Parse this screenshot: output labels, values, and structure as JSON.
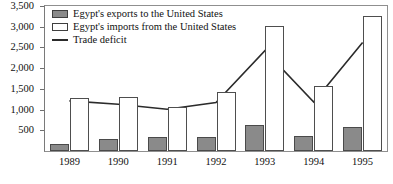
{
  "chart_data": {
    "type": "bar",
    "title": "",
    "subtitle": "",
    "xlabel": "",
    "ylabel": "",
    "categories": [
      "1989",
      "1990",
      "1991",
      "1992",
      "1993",
      "1994",
      "1995"
    ],
    "ylim": [
      0,
      3500
    ],
    "yticks": [
      500,
      1000,
      1500,
      2000,
      2500,
      3000,
      3500
    ],
    "ytick_labels": [
      "500",
      "1,000",
      "1,500",
      "2,000",
      "2,500",
      "3,000",
      "3,500"
    ],
    "grid": false,
    "legend_position": "top-left",
    "series": [
      {
        "name": "Egypt's exports to the United States",
        "kind": "bar",
        "color": "#8a8a8a",
        "values": [
          180,
          280,
          330,
          330,
          620,
          370,
          570
        ]
      },
      {
        "name": "Egypt's imports from the United States",
        "kind": "bar",
        "color": "#ffffff",
        "values": [
          1280,
          1300,
          1060,
          1430,
          3010,
          1560,
          3250
        ]
      },
      {
        "name": "Trade deficit",
        "kind": "line",
        "color": "#2b2b2b",
        "values": [
          1210,
          1130,
          1010,
          1170,
          2420,
          1180,
          2620
        ]
      }
    ]
  },
  "legend": {
    "items": [
      {
        "label": "Egypt's exports to the United States",
        "swatch": "exports"
      },
      {
        "label": "Egypt's imports from the United States",
        "swatch": "imports"
      },
      {
        "label": "Trade deficit",
        "swatch": "line"
      }
    ]
  }
}
